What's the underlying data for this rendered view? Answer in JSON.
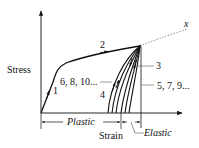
{
  "axes": {
    "y_label": "Stress",
    "x_label": "Strain"
  },
  "curve_labels": {
    "segment_1": "1",
    "segment_2": "2",
    "segment_3": "3",
    "segment_4": "4",
    "loading_cycles": "6, 8, 10...",
    "unloading_cycles": "5, 7, 9...",
    "fracture": "x"
  },
  "strain_regions": {
    "plastic": "Plastic",
    "elastic": "Elastic"
  },
  "colors": {
    "line": "#111111",
    "leader": "#555555",
    "dotted": "#777777"
  }
}
